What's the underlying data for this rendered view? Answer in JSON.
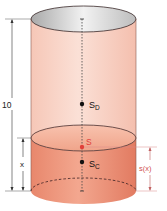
{
  "diagram": {
    "labels": {
      "height": "10",
      "fill_height": "x",
      "centroid_can": "S",
      "centroid_can_sub": "D",
      "centroid_liquid": "S",
      "centroid_liquid_sub": "C",
      "combined_centroid": "S",
      "combined_height": "s(x)"
    },
    "colors": {
      "can_body": "#f9d2c4",
      "liquid": "#ee9a80",
      "liquid_dark": "#e07a60",
      "outline": "#3a2a2a",
      "accent_red": "#e0403a",
      "dimension_line": "#333333",
      "s_x_line": "#d96a6a",
      "top_inner": "#c8c8c8"
    }
  }
}
